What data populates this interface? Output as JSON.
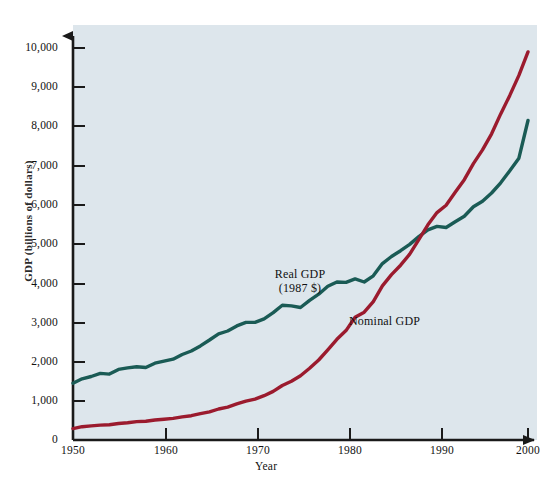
{
  "chart_data": {
    "type": "line",
    "title": "",
    "xlabel": "Year",
    "ylabel": "GDP (billions of dollars)",
    "xlim": [
      1950,
      2000
    ],
    "ylim": [
      0,
      10000
    ],
    "grid": false,
    "legend_position": "inline-annotations",
    "x_tick_labels": [
      "1950",
      "1960",
      "1970",
      "1980",
      "1990",
      "2000"
    ],
    "x_ticks": [
      1950,
      1960,
      1970,
      1980,
      1990,
      2000
    ],
    "y_tick_labels": [
      "0",
      "1,000",
      "2,000",
      "3,000",
      "4,000",
      "5,000",
      "6,000",
      "7,000",
      "8,000",
      "9,000",
      "10,000"
    ],
    "y_ticks": [
      0,
      1000,
      2000,
      3000,
      4000,
      5000,
      6000,
      7000,
      8000,
      9000,
      10000
    ],
    "annotations": [
      {
        "name": "real-gdp-label",
        "text_line1": "Real GDP",
        "text_line2": "(1987 $)"
      },
      {
        "name": "nominal-gdp-label",
        "text_line1": "Nominal GDP"
      }
    ],
    "colors": {
      "real_gdp": "#1a5b55",
      "nominal_gdp": "#9b1b2e",
      "plot_background": "#dde6ec",
      "axis": "#1a1a1a",
      "page_background": "#ffffff"
    },
    "x": [
      1950,
      1951,
      1952,
      1953,
      1954,
      1955,
      1956,
      1957,
      1958,
      1959,
      1960,
      1961,
      1962,
      1963,
      1964,
      1965,
      1966,
      1967,
      1968,
      1969,
      1970,
      1971,
      1972,
      1973,
      1974,
      1975,
      1976,
      1977,
      1978,
      1979,
      1980,
      1981,
      1982,
      1983,
      1984,
      1985,
      1986,
      1987,
      1988,
      1989,
      1990,
      1991,
      1992,
      1993,
      1994,
      1995,
      1996,
      1997,
      1998,
      1999,
      2000
    ],
    "series": [
      {
        "name": "Real GDP (1987 $)",
        "color": "#1a5b55",
        "values": [
          1450,
          1560,
          1620,
          1700,
          1680,
          1800,
          1840,
          1870,
          1850,
          1960,
          2010,
          2060,
          2180,
          2270,
          2400,
          2550,
          2710,
          2780,
          2910,
          3000,
          3000,
          3090,
          3250,
          3440,
          3420,
          3380,
          3560,
          3720,
          3920,
          4030,
          4020,
          4110,
          4030,
          4190,
          4500,
          4680,
          4830,
          4990,
          5190,
          5360,
          5450,
          5420,
          5570,
          5710,
          5950,
          6090,
          6300,
          6560,
          6870,
          7190,
          8150
        ]
      },
      {
        "name": "Nominal GDP",
        "color": "#9b1b2e",
        "values": [
          290,
          340,
          360,
          380,
          390,
          420,
          440,
          470,
          480,
          510,
          530,
          550,
          590,
          620,
          670,
          720,
          790,
          840,
          920,
          990,
          1040,
          1130,
          1240,
          1390,
          1500,
          1640,
          1830,
          2040,
          2300,
          2570,
          2790,
          3130,
          3260,
          3530,
          3930,
          4220,
          4460,
          4740,
          5110,
          5490,
          5800,
          5990,
          6320,
          6640,
          7050,
          7400,
          7810,
          8320,
          8790,
          9300,
          9900
        ]
      }
    ]
  },
  "footer": {
    "ghost_text": ""
  }
}
